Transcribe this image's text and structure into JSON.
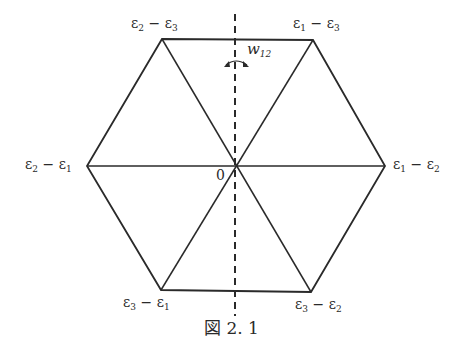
{
  "figure": {
    "caption": "図 2. 1",
    "type": "root-system-hexagon",
    "vertices": {
      "top_left": {
        "label_a": "ε",
        "sub_a": "2",
        "op": " − ",
        "label_b": "ε",
        "sub_b": "3",
        "x": 162,
        "y": 39
      },
      "top_right": {
        "label_a": "ε",
        "sub_a": "1",
        "op": " − ",
        "label_b": "ε",
        "sub_b": "3",
        "x": 313,
        "y": 40
      },
      "left": {
        "label_a": "ε",
        "sub_a": "2",
        "op": " − ",
        "label_b": "ε",
        "sub_b": "1",
        "x": 87,
        "y": 166
      },
      "right": {
        "label_a": "ε",
        "sub_a": "1",
        "op": " − ",
        "label_b": "ε",
        "sub_b": "2",
        "x": 385,
        "y": 166
      },
      "bottom_left": {
        "label_a": "ε",
        "sub_a": "3",
        "op": " − ",
        "label_b": "ε",
        "sub_b": "1",
        "x": 161,
        "y": 290
      },
      "bottom_right": {
        "label_a": "ε",
        "sub_a": "3",
        "op": " − ",
        "label_b": "ε",
        "sub_b": "2",
        "x": 311,
        "y": 292
      }
    },
    "origin": {
      "label": "0",
      "x": 236,
      "y": 166
    },
    "reflection_axis": {
      "label": "w",
      "sub": "12",
      "style": "dashed",
      "x": 235,
      "y1": 14,
      "y2": 316
    },
    "colors": {
      "line": "#2a2a2a",
      "background": "#ffffff"
    }
  }
}
